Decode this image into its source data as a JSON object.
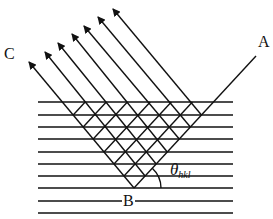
{
  "diagram": {
    "type": "bragg-diffraction-schematic",
    "labels": {
      "C": "C",
      "A": "A",
      "B": "B",
      "theta": "θ",
      "theta_subscript": "hkl"
    },
    "colors": {
      "line": "#111111",
      "background": "#ffffff"
    },
    "geometry": {
      "horizontal_lines_y": [
        102,
        115,
        127,
        139,
        152,
        164,
        176,
        188,
        201,
        213
      ],
      "horizontal_x_start": 38,
      "horizontal_x_end": 233,
      "apex_B": [
        134,
        188
      ],
      "point_A_end": [
        256,
        56
      ],
      "arrow_count": 7,
      "up_left_slope_dx_per_dy": 0.833,
      "up_right_slope_dx_per_dy": 0.924,
      "arrow_tips": [
        [
          29,
          62
        ],
        [
          45,
          52
        ],
        [
          58,
          43
        ],
        [
          72,
          34
        ],
        [
          84,
          26
        ],
        [
          98,
          17
        ],
        [
          113,
          9
        ]
      ]
    }
  }
}
